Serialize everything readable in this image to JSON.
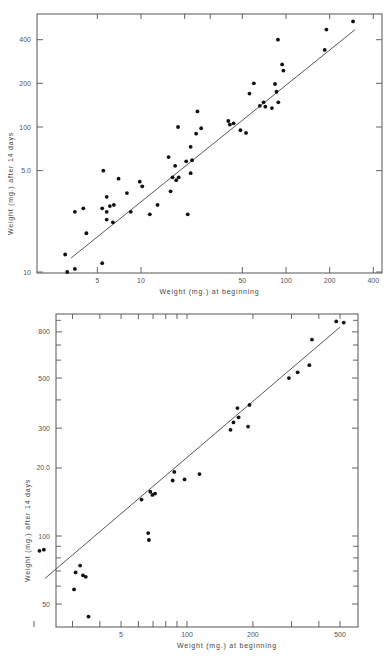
{
  "chart_data": [
    {
      "type": "scatter",
      "title": "",
      "xlabel": "Weight (mg.) at beginning",
      "ylabel": "Weight (mg.) after 14 days",
      "xscale": "log",
      "yscale": "log",
      "xlim": [
        2.6,
        500
      ],
      "ylim": [
        10,
        560
      ],
      "xticks": [
        5,
        10,
        50,
        100,
        200,
        400
      ],
      "xtick_labels": [
        "5",
        "10",
        "50",
        "100",
        "200",
        "400"
      ],
      "xticks_minor_top": [
        20,
        30
      ],
      "yticks": [
        10,
        50,
        100,
        200,
        400
      ],
      "ytick_labels": [
        "10",
        "5.0",
        "100",
        "200",
        "400"
      ],
      "grid": false,
      "frame": {
        "left": 37,
        "right": 382,
        "top": 14,
        "bottom": 273
      },
      "x_px": {
        "ref_value": 10,
        "ref_px": 141,
        "px_per_decade": 145
      },
      "y_px": {
        "ref_value": 10,
        "ref_px": 272,
        "px_per_decade": 145
      },
      "fit_line": {
        "x": [
          3.3,
          300
        ],
        "y": [
          12.5,
          470
        ]
      },
      "points": [
        [
          3.0,
          13.2
        ],
        [
          3.1,
          10.0
        ],
        [
          3.5,
          10.5
        ],
        [
          3.5,
          26
        ],
        [
          4.0,
          27.5
        ],
        [
          4.2,
          18.5
        ],
        [
          5.4,
          11.5
        ],
        [
          5.4,
          27.5
        ],
        [
          5.5,
          50
        ],
        [
          5.8,
          23
        ],
        [
          5.8,
          33
        ],
        [
          5.8,
          26
        ],
        [
          6.1,
          28.5
        ],
        [
          6.4,
          22
        ],
        [
          6.5,
          29
        ],
        [
          7.0,
          44
        ],
        [
          8.0,
          35
        ],
        [
          8.5,
          26
        ],
        [
          9.8,
          42
        ],
        [
          10.2,
          39
        ],
        [
          11.5,
          25
        ],
        [
          13.0,
          29
        ],
        [
          15.5,
          62
        ],
        [
          16.0,
          36
        ],
        [
          16.5,
          45
        ],
        [
          17.5,
          43
        ],
        [
          17.2,
          54
        ],
        [
          18.2,
          45
        ],
        [
          18.0,
          100
        ],
        [
          20.5,
          58
        ],
        [
          21.0,
          25
        ],
        [
          22.0,
          48
        ],
        [
          22.0,
          73
        ],
        [
          22.5,
          59
        ],
        [
          24.0,
          90
        ],
        [
          24.5,
          128
        ],
        [
          26.0,
          98
        ],
        [
          40.0,
          110
        ],
        [
          41.0,
          104
        ],
        [
          43.5,
          106
        ],
        [
          48.5,
          95
        ],
        [
          53.0,
          91
        ],
        [
          56.0,
          170
        ],
        [
          60.0,
          200
        ],
        [
          66.0,
          140
        ],
        [
          70.0,
          148
        ],
        [
          72.0,
          138
        ],
        [
          80.0,
          135
        ],
        [
          84.0,
          198
        ],
        [
          86.0,
          175
        ],
        [
          88.5,
          148
        ],
        [
          88.0,
          400
        ],
        [
          94.0,
          270
        ],
        [
          96.0,
          245
        ],
        [
          185.0,
          340
        ],
        [
          190.0,
          470
        ],
        [
          290.0,
          535
        ]
      ]
    },
    {
      "type": "scatter",
      "title": "",
      "xlabel": "Weight (mg.) at beginning",
      "ylabel": "Weight (mg.) after 14 days",
      "xscale": "log",
      "yscale": "log",
      "xlim": [
        19.5,
        590
      ],
      "ylim": [
        43,
        920
      ],
      "xticks": [
        50,
        100,
        200,
        500
      ],
      "xtick_labels": [
        "5",
        "100",
        "200",
        "500"
      ],
      "xticks_minor": [
        20,
        30,
        40,
        60,
        70,
        80,
        90,
        300,
        400
      ],
      "yticks": [
        50,
        100,
        200,
        300,
        500,
        800
      ],
      "ytick_labels": [
        "50",
        "100",
        "20.0",
        "300",
        "500",
        "800"
      ],
      "yticks_minor": [
        60,
        70,
        80,
        90,
        400,
        600,
        700,
        900
      ],
      "grid": false,
      "frame": {
        "left": 56,
        "right": 358,
        "top": 314,
        "bottom": 627
      },
      "x_px": {
        "ref_value": 100,
        "ref_px": 187,
        "px_per_decade": 219
      },
      "y_px": {
        "ref_value": 100,
        "ref_px": 536,
        "px_per_decade": 226
      },
      "fit_line": {
        "x": [
          22.5,
          500
        ],
        "y": [
          65,
          840
        ]
      },
      "points": [
        [
          21.2,
          86
        ],
        [
          22.2,
          87
        ],
        [
          30.5,
          58
        ],
        [
          31.0,
          69
        ],
        [
          32.5,
          74
        ],
        [
          33.5,
          67
        ],
        [
          34.5,
          66
        ],
        [
          35.5,
          44
        ],
        [
          62.0,
          145
        ],
        [
          66.5,
          103
        ],
        [
          67.0,
          96
        ],
        [
          68.0,
          157
        ],
        [
          69.5,
          152
        ],
        [
          71.5,
          154
        ],
        [
          86.0,
          176
        ],
        [
          87.5,
          192
        ],
        [
          97.5,
          178
        ],
        [
          114.0,
          188
        ],
        [
          158.0,
          295
        ],
        [
          163.0,
          318
        ],
        [
          170.0,
          368
        ],
        [
          172.0,
          335
        ],
        [
          190.0,
          305
        ],
        [
          193.0,
          380
        ],
        [
          292.0,
          500
        ],
        [
          320.0,
          530
        ],
        [
          362.0,
          570
        ],
        [
          372.0,
          740
        ],
        [
          480.0,
          890
        ],
        [
          520.0,
          880
        ]
      ]
    }
  ]
}
